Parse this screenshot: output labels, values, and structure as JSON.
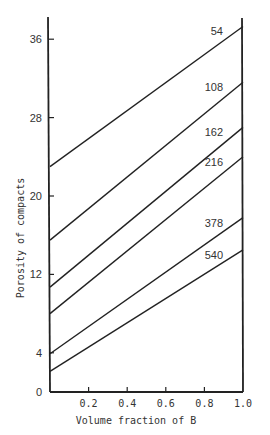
{
  "chart_data": {
    "type": "line",
    "title": "",
    "xlabel": "Volume fraction of B",
    "ylabel": "Porosity of compacts",
    "xlim": [
      0,
      1.0
    ],
    "ylim": [
      0,
      37
    ],
    "x_ticks": [
      0.2,
      0.4,
      0.6,
      0.8,
      1.0
    ],
    "x_tick_labels": [
      "0.2",
      "0.4",
      "0.6",
      "0.8",
      "1.0"
    ],
    "y_ticks": [
      0,
      4,
      12,
      20,
      28,
      36
    ],
    "y_tick_labels": [
      "0",
      "4",
      "12",
      "20",
      "28",
      "36"
    ],
    "grid": false,
    "legend": "inline labels at right end of each line",
    "x": [
      0,
      1.0
    ],
    "series": [
      {
        "name": "54",
        "values": [
          23.0,
          37.3
        ]
      },
      {
        "name": "108",
        "values": [
          15.5,
          31.6
        ]
      },
      {
        "name": "162",
        "values": [
          10.7,
          27.0
        ]
      },
      {
        "name": "216",
        "values": [
          8.0,
          24.0
        ]
      },
      {
        "name": "378",
        "values": [
          3.9,
          17.8
        ]
      },
      {
        "name": "540",
        "values": [
          2.1,
          14.5
        ]
      }
    ]
  },
  "layout": {
    "plot_left": 50,
    "plot_right": 243,
    "plot_bottom": 392,
    "plot_top": 17,
    "px_per_unit_y": 9.8,
    "line_color": "#222222"
  }
}
